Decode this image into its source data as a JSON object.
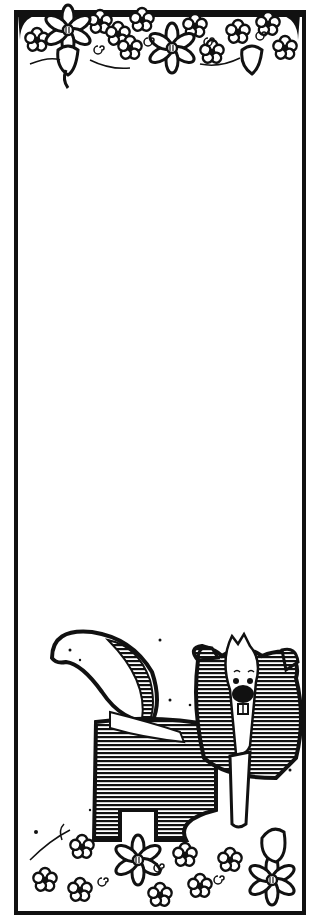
{
  "artwork": {
    "subject": "skunk-bookmark",
    "style": "black-and-white line art",
    "colors": {
      "ink": "#111111",
      "paper": "#ffffff"
    },
    "elements": [
      "floral-border-top",
      "blank-writing-area",
      "skunk",
      "floral-border-bottom"
    ]
  }
}
